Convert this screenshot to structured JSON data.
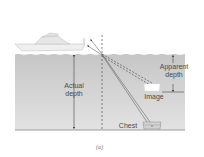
{
  "figure": {
    "labels": {
      "actual_depth_line1": "Actual",
      "actual_depth_line2": "depth",
      "apparent_depth_line1": "Apparent",
      "apparent_depth_line2": "depth",
      "image": "Image",
      "chest": "Chest"
    },
    "caption": "(a)",
    "colors": {
      "water_top": "#c9c9c9",
      "water_bottom": "#e4e4e4",
      "ray": "#555555",
      "boat": "#e8e8e8"
    }
  }
}
